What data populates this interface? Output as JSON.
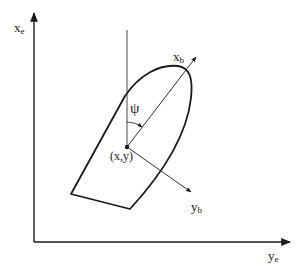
{
  "diagram": {
    "colors": {
      "background": "#ffffff",
      "stroke": "#1a1a1a",
      "text": "#222222"
    },
    "labels": {
      "earth_x_axis": {
        "main": "x",
        "sub": "e"
      },
      "earth_y_axis": {
        "main": "y",
        "sub": "e"
      },
      "body_x_axis": {
        "main": "x",
        "sub": "b"
      },
      "body_y_axis": {
        "main": "y",
        "sub": "b"
      },
      "heading_angle": "ψ",
      "position": "(x,y)"
    },
    "geometry": {
      "origin": [
        34,
        242
      ],
      "earth_x_axis_tip": [
        34,
        12
      ],
      "earth_y_axis_tip": [
        291,
        242
      ],
      "ship_position": [
        127,
        147
      ],
      "reference_line_top": [
        127,
        30
      ],
      "body_x_axis_tip": [
        196,
        57
      ],
      "body_y_axis_tip": [
        191,
        192
      ],
      "hull_stern_left": [
        71,
        194
      ],
      "hull_stern_right": [
        130,
        209
      ]
    }
  }
}
